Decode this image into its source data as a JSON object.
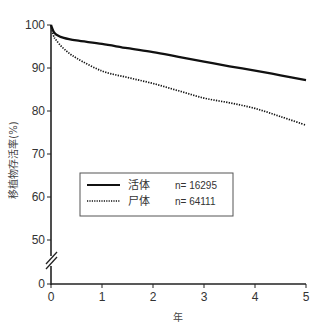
{
  "chart_data": {
    "type": "line",
    "title": "",
    "xlabel": "年",
    "ylabel": "移植物存活率(%)",
    "xlim": [
      0,
      5
    ],
    "ylim": [
      0,
      100
    ],
    "axis_break": {
      "between": [
        0,
        50
      ],
      "marker": "double-slash"
    },
    "x_ticks": [
      0,
      1,
      2,
      3,
      4,
      5
    ],
    "y_ticks": [
      0,
      50,
      60,
      70,
      80,
      90,
      100
    ],
    "grid": false,
    "legend_position": "inside-center-left",
    "series": [
      {
        "name": "活体",
        "n_label": "n= 16295",
        "style": "solid",
        "color": "#111111",
        "x": [
          0,
          0.05,
          0.1,
          0.25,
          0.5,
          1,
          1.5,
          2,
          2.5,
          3,
          3.5,
          4,
          4.5,
          5
        ],
        "y": [
          100,
          98.5,
          97.8,
          97.0,
          96.4,
          95.6,
          94.6,
          93.7,
          92.6,
          91.5,
          90.4,
          89.4,
          88.3,
          87.2
        ]
      },
      {
        "name": "尸体",
        "n_label": "n= 64111",
        "style": "dotted",
        "color": "#111111",
        "x": [
          0,
          0.05,
          0.1,
          0.25,
          0.5,
          1,
          1.5,
          2,
          2.5,
          3,
          3.5,
          4,
          4.5,
          5
        ],
        "y": [
          100,
          97.5,
          96.5,
          94.5,
          92.3,
          89.3,
          87.8,
          86.4,
          84.7,
          83.0,
          81.9,
          80.6,
          78.7,
          76.7
        ]
      }
    ]
  }
}
